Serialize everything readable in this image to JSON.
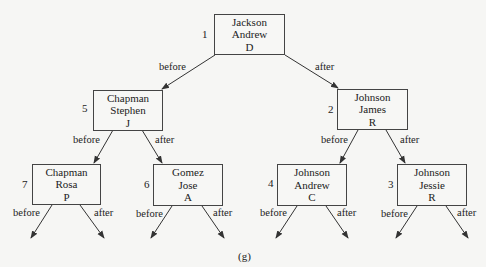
{
  "caption": "(g)",
  "edge_labels": {
    "left": "before",
    "right": "after"
  },
  "nodes": [
    {
      "id": "root",
      "order": "1",
      "last": "Jackson",
      "first": "Andrew",
      "initial": "D"
    },
    {
      "id": "l",
      "order": "5",
      "last": "Chapman",
      "first": "Stephen",
      "initial": "J"
    },
    {
      "id": "r",
      "order": "2",
      "last": "Johnson",
      "first": "James",
      "initial": "R"
    },
    {
      "id": "ll",
      "order": "7",
      "last": "Chapman",
      "first": "Rosa",
      "initial": "P"
    },
    {
      "id": "lr",
      "order": "6",
      "last": "Gomez",
      "first": "Jose",
      "initial": "A"
    },
    {
      "id": "rl",
      "order": "4",
      "last": "Johnson",
      "first": "Andrew",
      "initial": "C"
    },
    {
      "id": "rr",
      "order": "3",
      "last": "Johnson",
      "first": "Jessie",
      "initial": "R"
    }
  ]
}
